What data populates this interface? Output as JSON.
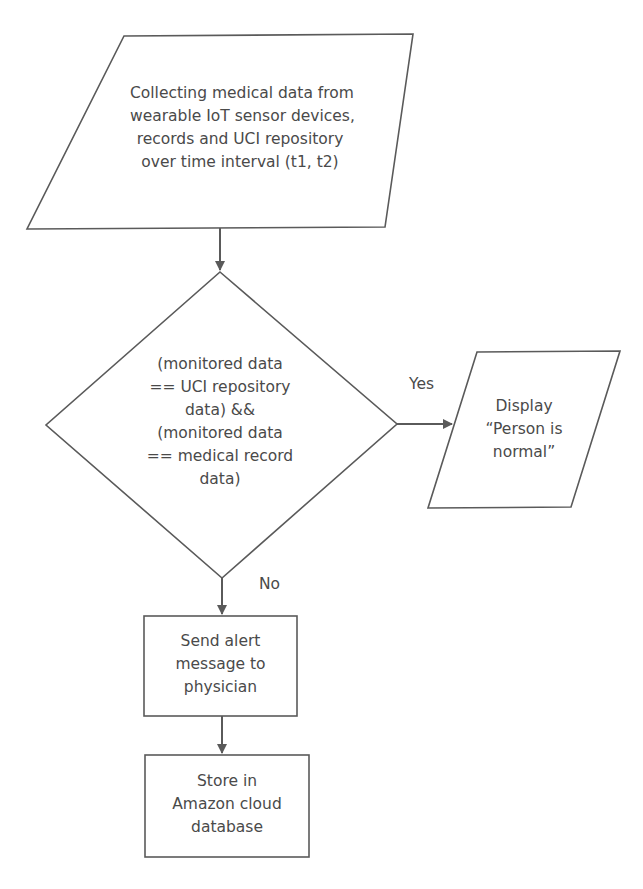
{
  "diagram": {
    "type": "flowchart",
    "colors": {
      "stroke": "#5a5a5a",
      "text": "#4a4a4a",
      "background": "#ffffff"
    },
    "nodes": {
      "collect": {
        "shape": "parallelogram",
        "lines": [
          "Collecting medical data from",
          "wearable IoT sensor devices,",
          "records and UCI repository",
          "over time interval (t1, t2)"
        ]
      },
      "decision": {
        "shape": "diamond",
        "lines": [
          "(monitored data",
          "== UCI repository",
          "data) &&",
          "(monitored data",
          "== medical record",
          "data)"
        ]
      },
      "display": {
        "shape": "parallelogram",
        "lines": [
          "Display",
          "“Person is",
          "normal”"
        ]
      },
      "alert": {
        "shape": "rectangle",
        "lines": [
          "Send alert",
          "message to",
          "physician"
        ]
      },
      "store": {
        "shape": "rectangle",
        "lines": [
          "Store in",
          "Amazon cloud",
          "database"
        ]
      }
    },
    "edges": {
      "yes_label": "Yes",
      "no_label": "No"
    }
  }
}
